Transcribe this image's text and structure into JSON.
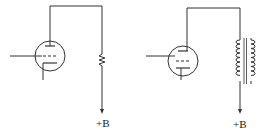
{
  "diagram": {
    "circuits": [
      {
        "id": "resistor-load",
        "tube": "triode",
        "load": "resistor",
        "supply_label": "+B"
      },
      {
        "id": "inductor-load",
        "tube": "triode",
        "load": "iron-core inductor",
        "supply_label": "+B"
      }
    ],
    "colors": {
      "line": "#333333",
      "background": "#ffffff"
    }
  }
}
